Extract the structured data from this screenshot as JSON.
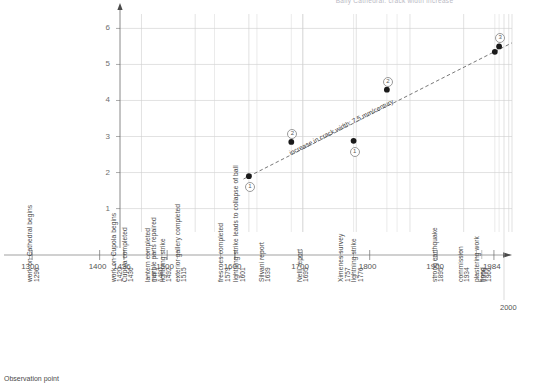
{
  "title": "Baily Cathedral: crack width increase",
  "footer_label": "Observation point",
  "end_year_label": "2000",
  "annotation": "increase in crack width: 7.5 mm/century",
  "chart_data": {
    "type": "scatter",
    "title": "Baily Cathedral: crack width increase",
    "xlabel": "",
    "ylabel": "",
    "xlim": [
      1260,
      1990
    ],
    "ylim": [
      0.35,
      6.4
    ],
    "grid": true,
    "legend": null,
    "xticks": [
      1300,
      1400,
      1436,
      1500,
      1600,
      1700,
      1800,
      1900,
      1984
    ],
    "xtick_labels": [
      "1300",
      "1400",
      "1436",
      "1500",
      "1600",
      "1700",
      "1800",
      "1900",
      "1984"
    ],
    "yticks": [
      1,
      2,
      3,
      4,
      5,
      6
    ],
    "ytick_labels": [
      "1",
      "2",
      "3",
      "4",
      "5",
      "6"
    ],
    "points": [
      {
        "x": 1500,
        "y": 1.9,
        "marker_label": "1"
      },
      {
        "x": 1579,
        "y": 2.85,
        "marker_label": "2"
      },
      {
        "x": 1695,
        "y": 2.88,
        "marker_label": "1"
      },
      {
        "x": 1757,
        "y": 4.3,
        "marker_label": "2"
      },
      {
        "x": 1958,
        "y": 5.35,
        "marker_label": ""
      },
      {
        "x": 1966,
        "y": 5.5,
        "marker_label": "3"
      }
    ],
    "trend_line": {
      "style": "dashed",
      "label": "increase in crack width: 7.5 mm/century",
      "x0": 1490,
      "y0": 1.82,
      "x1": 1990,
      "y1": 5.6
    },
    "events": [
      {
        "year": 1296,
        "year_label": "1296",
        "label": "work on Cathedral begins"
      },
      {
        "year": 1420,
        "year_label": "1420",
        "label": "work on Cupola begins"
      },
      {
        "year": 1436,
        "year_label": "1436",
        "label": "Cupola completed"
      },
      {
        "year": 1471,
        "year_label": "1471",
        "label": "lantern completed"
      },
      {
        "year": 1480,
        "year_label": "1480",
        "label": "marble parts repaired"
      },
      {
        "year": 1492,
        "year_label": "1492",
        "label": "lightning strike"
      },
      {
        "year": 1515,
        "year_label": "1515",
        "label": "exterior gallery completed"
      },
      {
        "year": 1579,
        "year_label": "1579",
        "label": "frescoes completed"
      },
      {
        "year": 1601,
        "year_label": "1601",
        "label": "lightning strike leads to collapse of ball"
      },
      {
        "year": 1639,
        "year_label": "1639",
        "label": "Silvani report"
      },
      {
        "year": 1695,
        "year_label": "1695",
        "label": "Nelli report"
      },
      {
        "year": 1757,
        "year_label": "1757",
        "label": "Ximenes survey"
      },
      {
        "year": 1776,
        "year_label": "1776",
        "label": "lightning strike"
      },
      {
        "year": 1895,
        "year_label": "1895",
        "label": "strong earthquake"
      },
      {
        "year": 1934,
        "year_label": "1934",
        "label": "commission"
      },
      {
        "year": 1958,
        "year_label": "1958",
        "label": "plastering work"
      },
      {
        "year": 1966,
        "year_label": "1966",
        "label": "flood"
      }
    ]
  }
}
